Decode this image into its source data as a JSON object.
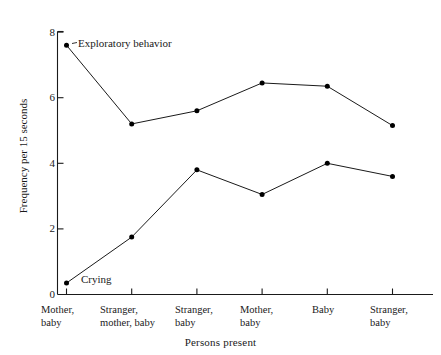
{
  "chart_data": {
    "type": "line",
    "title": "",
    "xlabel": "Persons present",
    "ylabel": "Frequency per 15 seconds",
    "categories": [
      "Mother, baby",
      "Stranger, mother, baby",
      "Stranger, baby",
      "Mother, baby",
      "Baby",
      "Stranger, baby"
    ],
    "category_lines": [
      [
        "Mother,",
        "baby"
      ],
      [
        "Stranger,",
        "mother, baby"
      ],
      [
        "Stranger,",
        "baby"
      ],
      [
        "Mother,",
        "baby"
      ],
      [
        "Baby",
        ""
      ],
      [
        "Stranger,",
        "baby"
      ]
    ],
    "series": [
      {
        "name": "Exploratory behavior",
        "values": [
          7.6,
          5.2,
          5.6,
          6.45,
          6.35,
          5.15
        ]
      },
      {
        "name": "Crying",
        "values": [
          0.35,
          1.75,
          3.8,
          3.05,
          4.0,
          3.6
        ]
      }
    ],
    "ylim": [
      0,
      8
    ],
    "yticks": [
      0,
      2,
      4,
      6,
      8
    ],
    "ytick_labels": [
      "0",
      "2",
      "4",
      "6",
      "8"
    ],
    "grid": false,
    "legend": "inline-annotations",
    "line_color": "#1a1a1a",
    "marker_color": "#000000",
    "background_color": "#ffffff"
  },
  "annotations": {
    "exploratory_label": "Exploratory behavior",
    "crying_label": "Crying"
  }
}
